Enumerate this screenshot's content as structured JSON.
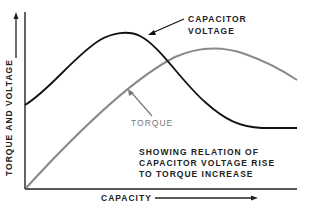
{
  "labels": {
    "capacitor_voltage_line1": "CAPACITOR",
    "capacitor_voltage_line2": "VOLTAGE",
    "torque": "TORQUE",
    "caption_line1": "SHOWING RELATION OF",
    "caption_line2": "CAPACITOR VOLTAGE RISE",
    "caption_line3": "TO TORQUE INCREASE",
    "x_axis": "CAPACITY",
    "y_axis": "TORQUE AND VOLTAGE"
  },
  "colors": {
    "voltage_curve": "#111111",
    "torque_curve": "#8a8a8a",
    "axis": "#222222"
  }
}
